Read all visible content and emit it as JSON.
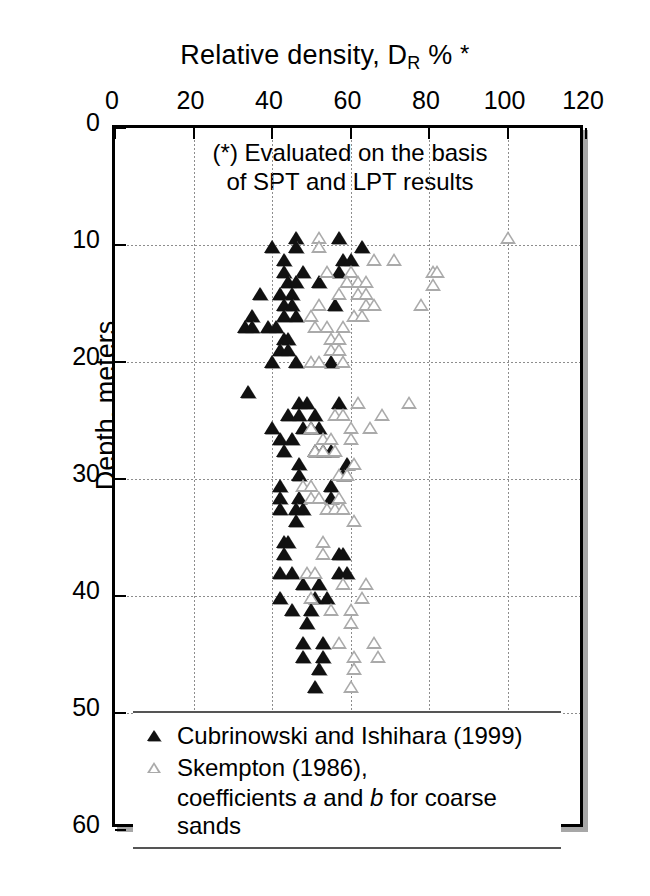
{
  "chart_data": {
    "type": "scatter",
    "title_parts": {
      "main": "Relative density, D",
      "sub": "R",
      "tail": "%",
      "star": "*"
    },
    "xlabel": "Relative density, D_R % *",
    "ylabel": "Depth, meters",
    "xlim": [
      0,
      120
    ],
    "ylim": [
      0,
      60
    ],
    "y_inverted": true,
    "xticks": [
      0,
      20,
      40,
      60,
      80,
      100,
      120
    ],
    "yticks": [
      0,
      10,
      20,
      30,
      40,
      50,
      60
    ],
    "grid": true,
    "legend_position": "inside-bottom-left",
    "annotation": [
      "(*) Evaluated on the basis",
      "of SPT and LPT results"
    ],
    "series": [
      {
        "name": "Cubrinowski and Ishihara (1999)",
        "marker": "filled-triangle",
        "color": "#111111",
        "points": [
          [
            46,
            9.4
          ],
          [
            57,
            9.4
          ],
          [
            40,
            10.2
          ],
          [
            46,
            10.2
          ],
          [
            63,
            10.2
          ],
          [
            43,
            11.3
          ],
          [
            58,
            11.3
          ],
          [
            60,
            11.3
          ],
          [
            43,
            12.3
          ],
          [
            48,
            12.3
          ],
          [
            57,
            12.3
          ],
          [
            44,
            13.2
          ],
          [
            46,
            13.2
          ],
          [
            52,
            13.2
          ],
          [
            37,
            14.2
          ],
          [
            42,
            14.2
          ],
          [
            45,
            14.2
          ],
          [
            43,
            15.1
          ],
          [
            45,
            15.1
          ],
          [
            56,
            15.1
          ],
          [
            35,
            16.1
          ],
          [
            43,
            16.1
          ],
          [
            46,
            16.1
          ],
          [
            33,
            17.0
          ],
          [
            35,
            17.0
          ],
          [
            39,
            17.0
          ],
          [
            41,
            17.0
          ],
          [
            43,
            18.0
          ],
          [
            44,
            18.0
          ],
          [
            42,
            19.0
          ],
          [
            44,
            19.0
          ],
          [
            40,
            20.0
          ],
          [
            46,
            20.0
          ],
          [
            55,
            20.0
          ],
          [
            34,
            22.6
          ],
          [
            47,
            23.5
          ],
          [
            49,
            23.5
          ],
          [
            57,
            23.5
          ],
          [
            44,
            24.5
          ],
          [
            47,
            24.5
          ],
          [
            51,
            24.5
          ],
          [
            40,
            25.6
          ],
          [
            48,
            25.6
          ],
          [
            50,
            25.6
          ],
          [
            52,
            25.6
          ],
          [
            42,
            26.6
          ],
          [
            45,
            26.6
          ],
          [
            43,
            27.6
          ],
          [
            51,
            27.6
          ],
          [
            53,
            27.6
          ],
          [
            55,
            27.6
          ],
          [
            47,
            28.7
          ],
          [
            59,
            28.7
          ],
          [
            47,
            29.7
          ],
          [
            58,
            29.7
          ],
          [
            42,
            30.6
          ],
          [
            55,
            30.6
          ],
          [
            42,
            31.6
          ],
          [
            47,
            31.6
          ],
          [
            55,
            31.6
          ],
          [
            42,
            32.6
          ],
          [
            46,
            32.6
          ],
          [
            48,
            32.6
          ],
          [
            46,
            33.6
          ],
          [
            43,
            35.4
          ],
          [
            44,
            35.4
          ],
          [
            43,
            36.4
          ],
          [
            57,
            36.4
          ],
          [
            58,
            36.4
          ],
          [
            42,
            38.0
          ],
          [
            45,
            38.0
          ],
          [
            57,
            38.0
          ],
          [
            59,
            38.0
          ],
          [
            48,
            39.0
          ],
          [
            52,
            39.0
          ],
          [
            42,
            40.2
          ],
          [
            51,
            40.2
          ],
          [
            54,
            40.2
          ],
          [
            45,
            41.2
          ],
          [
            50,
            41.2
          ],
          [
            49,
            42.3
          ],
          [
            48,
            44.0
          ],
          [
            53,
            44.0
          ],
          [
            48,
            45.2
          ],
          [
            53,
            45.2
          ],
          [
            52,
            46.2
          ],
          [
            51,
            47.8
          ]
        ]
      },
      {
        "name": "Skempton (1986), coefficients a and b for coarse sands",
        "marker": "open-triangle",
        "color": "#ffffff",
        "points": [
          [
            52,
            9.4
          ],
          [
            100,
            9.4
          ],
          [
            52,
            10.2
          ],
          [
            66,
            11.3
          ],
          [
            71,
            11.3
          ],
          [
            81,
            12.3
          ],
          [
            54,
            12.3
          ],
          [
            60,
            12.3
          ],
          [
            82,
            12.3
          ],
          [
            59,
            13.2
          ],
          [
            62,
            13.2
          ],
          [
            64,
            13.2
          ],
          [
            81,
            13.4
          ],
          [
            57,
            14.2
          ],
          [
            62,
            14.2
          ],
          [
            64,
            14.2
          ],
          [
            78,
            15.1
          ],
          [
            52,
            15.1
          ],
          [
            64,
            15.1
          ],
          [
            66,
            15.1
          ],
          [
            50,
            16.1
          ],
          [
            61,
            16.1
          ],
          [
            63,
            16.1
          ],
          [
            51,
            17.0
          ],
          [
            54,
            17.0
          ],
          [
            58,
            17.0
          ],
          [
            55,
            18.0
          ],
          [
            57,
            18.0
          ],
          [
            55,
            19.0
          ],
          [
            57,
            19.0
          ],
          [
            50,
            20.0
          ],
          [
            52,
            20.0
          ],
          [
            58,
            20.0
          ],
          [
            62,
            23.5
          ],
          [
            75,
            23.5
          ],
          [
            56,
            24.5
          ],
          [
            58,
            24.5
          ],
          [
            68,
            24.5
          ],
          [
            50,
            25.6
          ],
          [
            60,
            25.6
          ],
          [
            65,
            25.6
          ],
          [
            53,
            26.6
          ],
          [
            55,
            26.6
          ],
          [
            60,
            26.6
          ],
          [
            51,
            27.6
          ],
          [
            53,
            27.6
          ],
          [
            56,
            27.6
          ],
          [
            61,
            28.7
          ],
          [
            57,
            29.7
          ],
          [
            59,
            29.7
          ],
          [
            48,
            30.6
          ],
          [
            50,
            30.6
          ],
          [
            50,
            31.6
          ],
          [
            52,
            31.6
          ],
          [
            57,
            31.6
          ],
          [
            54,
            32.6
          ],
          [
            56,
            32.6
          ],
          [
            58,
            32.6
          ],
          [
            61,
            33.6
          ],
          [
            53,
            35.4
          ],
          [
            53,
            36.4
          ],
          [
            49,
            38.0
          ],
          [
            51,
            38.0
          ],
          [
            58,
            39.0
          ],
          [
            64,
            39.0
          ],
          [
            50,
            40.2
          ],
          [
            63,
            40.2
          ],
          [
            55,
            41.2
          ],
          [
            60,
            41.2
          ],
          [
            60,
            42.3
          ],
          [
            57,
            44.0
          ],
          [
            66,
            44.0
          ],
          [
            61,
            45.2
          ],
          [
            67,
            45.2
          ],
          [
            61,
            46.2
          ],
          [
            60,
            47.8
          ]
        ]
      }
    ]
  },
  "legend": {
    "entries": [
      {
        "label": "Cubrinowski and Ishihara (1999)",
        "marker": "filled-triangle"
      },
      {
        "label": "Skempton (1986),",
        "marker": "open-triangle"
      }
    ],
    "continuation_prefix": "coefficients ",
    "continuation_a": "a",
    "continuation_mid": " and ",
    "continuation_b": "b",
    "continuation_suffix": " for coarse sands"
  }
}
